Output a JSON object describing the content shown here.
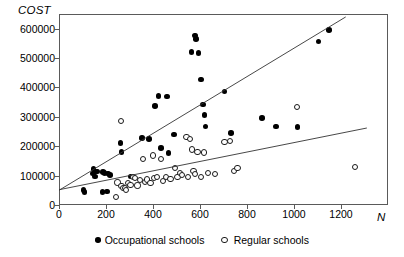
{
  "chart_data": {
    "type": "scatter",
    "title": "",
    "xlabel": "N",
    "ylabel": "COST",
    "xlim": [
      0,
      1400
    ],
    "ylim": [
      0,
      650000
    ],
    "grid": false,
    "legend_position": "bottom-center",
    "xticks": [
      0,
      200,
      400,
      600,
      800,
      1000,
      1200
    ],
    "yticks": [
      0,
      100000,
      200000,
      300000,
      400000,
      500000,
      600000
    ],
    "xtick_labels": [
      "0",
      "200",
      "400",
      "600",
      "800",
      "1000",
      "1200"
    ],
    "ytick_labels": [
      "0",
      "100000",
      "200000",
      "300000",
      "400000",
      "500000",
      "600000"
    ],
    "series": [
      {
        "name": "Occupational schools",
        "marker": "filled-circle",
        "color": "#000000",
        "points": [
          [
            100,
            55000
          ],
          [
            105,
            48000
          ],
          [
            140,
            110000
          ],
          [
            143,
            125000
          ],
          [
            150,
            100000
          ],
          [
            158,
            118000
          ],
          [
            180,
            48000
          ],
          [
            183,
            115000
          ],
          [
            190,
            112000
          ],
          [
            200,
            50000
          ],
          [
            205,
            110000
          ],
          [
            212,
            105000
          ],
          [
            258,
            215000
          ],
          [
            262,
            183000
          ],
          [
            300,
            100000
          ],
          [
            350,
            232000
          ],
          [
            378,
            228000
          ],
          [
            405,
            340000
          ],
          [
            420,
            375000
          ],
          [
            430,
            197000
          ],
          [
            455,
            372000
          ],
          [
            462,
            180000
          ],
          [
            485,
            243000
          ],
          [
            560,
            525000
          ],
          [
            575,
            580000
          ],
          [
            578,
            568000
          ],
          [
            590,
            520000
          ],
          [
            600,
            430000
          ],
          [
            608,
            345000
          ],
          [
            615,
            310000
          ],
          [
            620,
            270000
          ],
          [
            700,
            390000
          ],
          [
            728,
            248000
          ],
          [
            860,
            300000
          ],
          [
            920,
            270000
          ],
          [
            1010,
            268000
          ],
          [
            1100,
            560000
          ],
          [
            1145,
            598000
          ]
        ]
      },
      {
        "name": "Regular schools",
        "marker": "open-circle",
        "color": "#1a1a1a",
        "points": [
          [
            240,
            30000
          ],
          [
            245,
            80000
          ],
          [
            258,
            290000
          ],
          [
            262,
            68000
          ],
          [
            268,
            60000
          ],
          [
            275,
            62000
          ],
          [
            282,
            55000
          ],
          [
            290,
            78000
          ],
          [
            300,
            72000
          ],
          [
            310,
            100000
          ],
          [
            320,
            95000
          ],
          [
            330,
            70000
          ],
          [
            340,
            88000
          ],
          [
            352,
            160000
          ],
          [
            360,
            82000
          ],
          [
            370,
            90000
          ],
          [
            385,
            78000
          ],
          [
            395,
            172000
          ],
          [
            400,
            95000
          ],
          [
            412,
            100000
          ],
          [
            430,
            160000
          ],
          [
            440,
            85000
          ],
          [
            452,
            98000
          ],
          [
            470,
            92000
          ],
          [
            490,
            130000
          ],
          [
            500,
            100000
          ],
          [
            512,
            112000
          ],
          [
            520,
            105000
          ],
          [
            538,
            235000
          ],
          [
            545,
            98000
          ],
          [
            552,
            228000
          ],
          [
            560,
            192000
          ],
          [
            568,
            118000
          ],
          [
            575,
            108000
          ],
          [
            585,
            185000
          ],
          [
            600,
            100000
          ],
          [
            612,
            182000
          ],
          [
            630,
            112000
          ],
          [
            660,
            108000
          ],
          [
            700,
            218000
          ],
          [
            725,
            222000
          ],
          [
            740,
            120000
          ],
          [
            755,
            130000
          ],
          [
            1010,
            338000
          ],
          [
            1255,
            133000
          ]
        ]
      }
    ],
    "fit_lines": [
      {
        "for_series": "Occupational schools",
        "x_start": 0,
        "y_start": 50000,
        "x_end": 1220,
        "y_end": 640000
      },
      {
        "for_series": "Regular schools",
        "x_start": 0,
        "y_start": 52000,
        "x_end": 1310,
        "y_end": 262000
      }
    ]
  },
  "legend": {
    "items": [
      {
        "label": "Occupational schools",
        "marker": "filled-circle"
      },
      {
        "label": "Regular schools",
        "marker": "open-circle"
      }
    ]
  }
}
